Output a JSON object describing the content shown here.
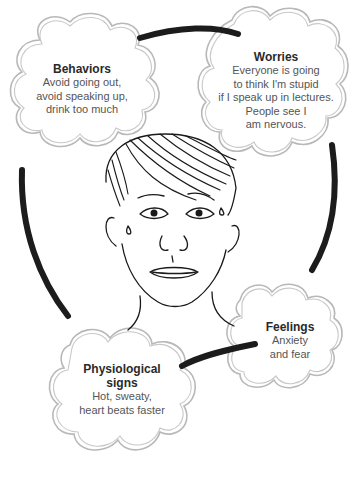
{
  "diagram": {
    "type": "cycle",
    "direction": "clockwise",
    "center_image": "illustrated-face-of-young-man",
    "nodes": [
      {
        "id": "behaviors",
        "title": "Behaviors",
        "body": "Avoid going out,\navoid speaking up,\ndrink too much"
      },
      {
        "id": "worries",
        "title": "Worries",
        "body": "Everyone is going\nto think I'm stupid\nif I speak up in lectures.\nPeople see I\nam nervous."
      },
      {
        "id": "feelings",
        "title": "Feelings",
        "body": "Anxiety\nand fear"
      },
      {
        "id": "physiological",
        "title": "Physiological\nsigns",
        "body": "Hot, sweaty,\nheart beats faster"
      }
    ],
    "edges": [
      {
        "from": "behaviors",
        "to": "worries"
      },
      {
        "from": "worries",
        "to": "feelings"
      },
      {
        "from": "feelings",
        "to": "physiological"
      },
      {
        "from": "physiological",
        "to": "behaviors"
      }
    ],
    "colors": {
      "cloud_outline": "#b8b8b8",
      "arrow": "#1c1c1c",
      "title_text": "#2a2a2a",
      "body_text": "#555555",
      "background": "#ffffff"
    }
  }
}
